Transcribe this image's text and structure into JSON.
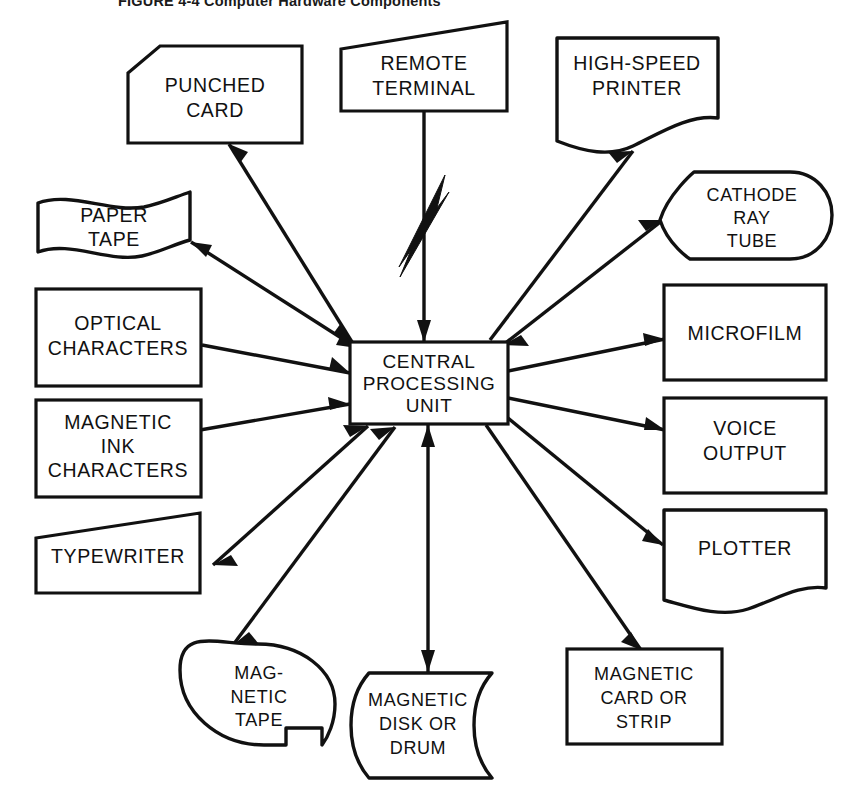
{
  "figure": {
    "number": "FIGURE 4-4",
    "caption": "Computer Hardware Components",
    "full_title": "FIGURE 4-4 Computer Hardware Components"
  },
  "colors": {
    "background": "#ffffff",
    "ink": "#111111",
    "title_ink": "#1a1a1a"
  },
  "center": {
    "id": "cpu",
    "shape": "rectangle",
    "lines": [
      "CENTRAL",
      "PROCESSING",
      "UNIT"
    ],
    "label": "CENTRAL PROCESSING UNIT"
  },
  "nodes": [
    {
      "id": "punched-card",
      "label": "PUNCHED CARD",
      "lines": [
        "PUNCHED",
        "CARD"
      ],
      "shape": "punched-card",
      "side": "left",
      "arrow": "bidirectional"
    },
    {
      "id": "remote-terminal",
      "label": "REMOTE TERMINAL",
      "lines": [
        "REMOTE",
        "TERMINAL"
      ],
      "shape": "manual-input",
      "side": "top",
      "arrow": "telecommunication-link"
    },
    {
      "id": "high-speed-printer",
      "label": "HIGH-SPEED PRINTER",
      "lines": [
        "HIGH-SPEED",
        "PRINTER"
      ],
      "shape": "document",
      "side": "right",
      "arrow": "out"
    },
    {
      "id": "paper-tape",
      "label": "PAPER TAPE",
      "lines": [
        "PAPER",
        "TAPE"
      ],
      "shape": "paper-tape",
      "side": "left",
      "arrow": "bidirectional"
    },
    {
      "id": "cathode-ray-tube",
      "label": "CATHODE RAY TUBE",
      "lines": [
        "CATHODE",
        "RAY",
        "TUBE"
      ],
      "shape": "display",
      "side": "right",
      "arrow": "bidirectional"
    },
    {
      "id": "optical-characters",
      "label": "OPTICAL CHARACTERS",
      "lines": [
        "OPTICAL",
        "CHARACTERS"
      ],
      "shape": "rectangle",
      "side": "left",
      "arrow": "in"
    },
    {
      "id": "microfilm",
      "label": "MICROFILM",
      "lines": [
        "MICROFILM"
      ],
      "shape": "rectangle",
      "side": "right",
      "arrow": "out"
    },
    {
      "id": "magnetic-ink-characters",
      "label": "MAGNETIC INK CHARACTERS",
      "lines": [
        "MAGNETIC",
        "INK",
        "CHARACTERS"
      ],
      "shape": "rectangle",
      "side": "left",
      "arrow": "in"
    },
    {
      "id": "voice-output",
      "label": "VOICE OUTPUT",
      "lines": [
        "VOICE",
        "OUTPUT"
      ],
      "shape": "rectangle",
      "side": "right",
      "arrow": "out"
    },
    {
      "id": "typewriter",
      "label": "TYPEWRITER",
      "lines": [
        "TYPEWRITER"
      ],
      "shape": "manual-input",
      "side": "left",
      "arrow": "bidirectional"
    },
    {
      "id": "plotter",
      "label": "PLOTTER",
      "lines": [
        "PLOTTER"
      ],
      "shape": "document",
      "side": "right",
      "arrow": "out"
    },
    {
      "id": "magnetic-tape",
      "label": "MAG- NETIC TAPE",
      "lines": [
        "MAG-",
        "NETIC",
        "TAPE"
      ],
      "shape": "magnetic-tape-reel",
      "side": "bottom-left",
      "arrow": "bidirectional"
    },
    {
      "id": "magnetic-disk-or-drum",
      "label": "MAGNETIC DISK OR DRUM",
      "lines": [
        "MAGNETIC",
        "DISK OR",
        "DRUM"
      ],
      "shape": "direct-access-storage",
      "side": "bottom",
      "arrow": "bidirectional"
    },
    {
      "id": "magnetic-card-or-strip",
      "label": "MAGNETIC CARD OR STRIP",
      "lines": [
        "MAGNETIC",
        "CARD OR",
        "STRIP"
      ],
      "shape": "rectangle",
      "side": "bottom-right",
      "arrow": "out"
    }
  ]
}
